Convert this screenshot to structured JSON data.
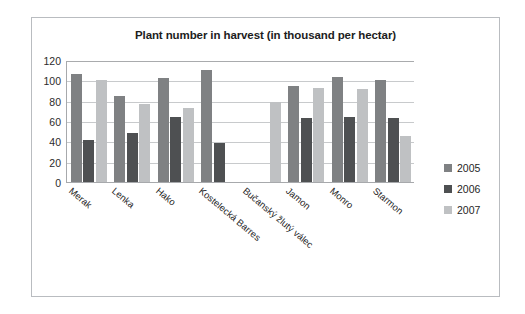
{
  "chart_data": {
    "type": "bar",
    "title": "Plant number in harvest (in thousand per hectar)",
    "xlabel": "",
    "ylabel": "",
    "ylim": [
      0,
      120
    ],
    "yticks": [
      0,
      20,
      40,
      60,
      80,
      100,
      120
    ],
    "grid": true,
    "legend_position": "right",
    "categories": [
      "Merak",
      "Lenka",
      "Hako",
      "Kostelecká Barres",
      "Bučanský žlutý válec",
      "Jamon",
      "Monro",
      "Starmon"
    ],
    "series": [
      {
        "name": "2005",
        "color": "#7f8183",
        "values": [
          106,
          85,
          102,
          110,
          null,
          94,
          103,
          100
        ]
      },
      {
        "name": "2006",
        "color": "#4e5052",
        "values": [
          41,
          48,
          64,
          38,
          null,
          63,
          64,
          63
        ]
      },
      {
        "name": "2007",
        "color": "#bfc1c3",
        "values": [
          100,
          77,
          73,
          null,
          79,
          92,
          91,
          45
        ]
      }
    ]
  },
  "legend": {
    "entries": [
      {
        "label": "2005",
        "series": "s2005"
      },
      {
        "label": "2006",
        "series": "s2006"
      },
      {
        "label": "2007",
        "series": "s2007"
      }
    ]
  }
}
